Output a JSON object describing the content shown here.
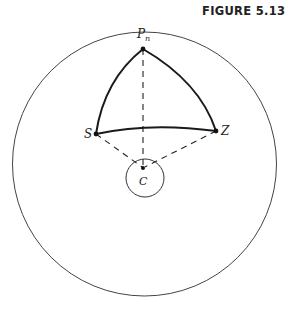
{
  "figure": {
    "title": "FIGURE 5.13"
  },
  "labels": {
    "pole": "P",
    "pole_sub": "n",
    "s": "S",
    "z": "Z",
    "c": "C"
  },
  "colors": {
    "stroke": "#222222",
    "circle": "#444444"
  }
}
